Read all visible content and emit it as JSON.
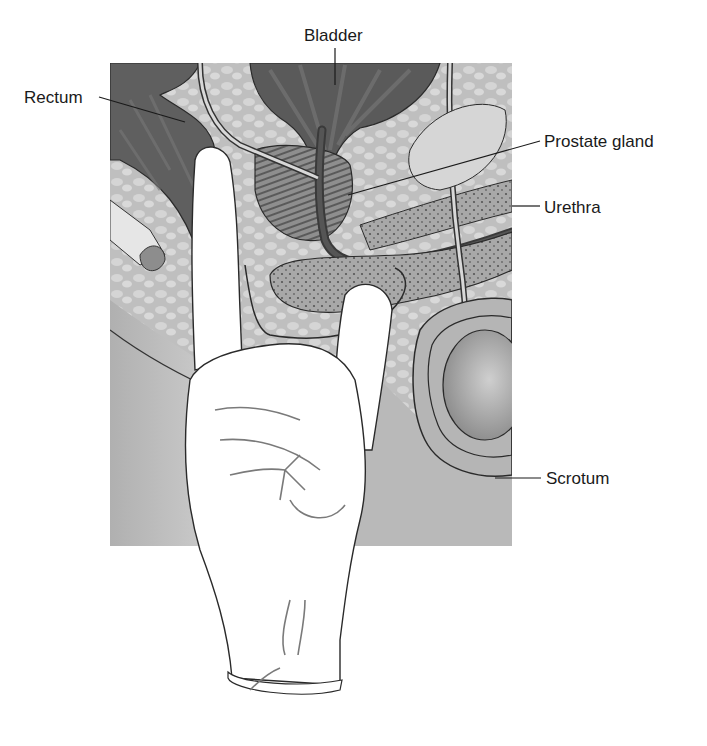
{
  "figure": {
    "colors": {
      "background": "#ffffff",
      "tissue_light": "#c9c9c9",
      "tissue_mid": "#9d9d9d",
      "tissue_dark": "#5e5e5e",
      "outline": "#2a2a2a",
      "glove": "#ffffff",
      "label_text": "#1a1a1a"
    }
  },
  "labels": {
    "bladder": "Bladder",
    "rectum": "Rectum",
    "prostate": "Prostate gland",
    "urethra": "Urethra",
    "scrotum": "Scrotum"
  }
}
